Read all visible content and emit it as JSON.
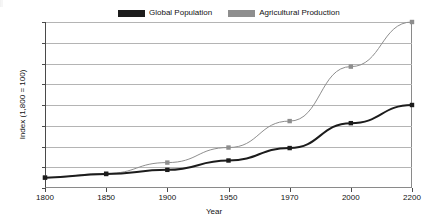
{
  "legend": {
    "position": "top-center",
    "entries": [
      {
        "label": "Global Population",
        "color": "#1c1c1c",
        "swatch": "legend-swatch-global-population"
      },
      {
        "label": "Agricultural Production",
        "color": "#8e8e8e",
        "swatch": "legend-swatch-agricultural-production"
      }
    ]
  },
  "axes": {
    "x_title": "Year",
    "y_title": "Index (1,800 = 100)",
    "y_ticks": [
      "0",
      "200",
      "400",
      "600",
      "800",
      "1,000",
      "1,200",
      "1,400",
      "1,600"
    ],
    "x_ticks": [
      "1800",
      "1850",
      "1900",
      "1950",
      "1970",
      "2000",
      "2200"
    ]
  },
  "chart_data": {
    "type": "line",
    "title": "",
    "xlabel": "Year",
    "ylabel": "Index (1,800 = 100)",
    "categories": [
      1800,
      1850,
      1900,
      1950,
      1970,
      2000,
      2200
    ],
    "xtick_labels": [
      "1800",
      "1850",
      "1900",
      "1950",
      "1970",
      "2000",
      "2200"
    ],
    "ytick_labels": [
      "0",
      "200",
      "400",
      "600",
      "800",
      "1,000",
      "1,200",
      "1,400",
      "1,600"
    ],
    "ylim": [
      0,
      1600
    ],
    "ytick_values": [
      0,
      200,
      400,
      600,
      800,
      1000,
      1200,
      1400,
      1600
    ],
    "grid": "horizontal",
    "legend_position": "top-center",
    "marker": "square",
    "series": [
      {
        "name": "Global Population",
        "color": "#1c1c1c",
        "line_width": 2,
        "values": [
          100,
          135,
          175,
          265,
          385,
          625,
          800
        ]
      },
      {
        "name": "Agricultural Production",
        "color": "#8e8e8e",
        "line_width": 1,
        "values": [
          100,
          140,
          245,
          390,
          645,
          1170,
          1600
        ]
      }
    ]
  }
}
